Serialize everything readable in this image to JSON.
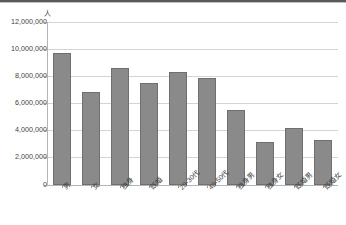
{
  "chart_data": {
    "type": "bar",
    "title": "",
    "xlabel": "",
    "ylabel": "人",
    "unit_label": "人",
    "categories": [
      "男",
      "女",
      "独身",
      "既婚",
      "20-30代",
      "40-50代",
      "独身男",
      "独身女",
      "既婚男",
      "既婚女"
    ],
    "values": [
      9700000,
      6850000,
      8600000,
      7500000,
      8300000,
      7900000,
      5500000,
      3200000,
      4200000,
      3300000
    ],
    "ylim": [
      0,
      12000000
    ],
    "ytick_labels": [
      "0",
      "2,000,000",
      "4,000,000",
      "6,000,000",
      "8,000,000",
      "10,000,000",
      "12,000,000"
    ],
    "ytick_values": [
      0,
      2000000,
      4000000,
      6000000,
      8000000,
      10000000,
      12000000
    ],
    "grid": true,
    "legend": "none",
    "bar_color": "#8a8a8a",
    "bar_border_color": "#6f6f6f",
    "gridline_color": "#d4d4d4",
    "axis_color": "#b5b5b5",
    "text_color": "#3f3f3f"
  }
}
